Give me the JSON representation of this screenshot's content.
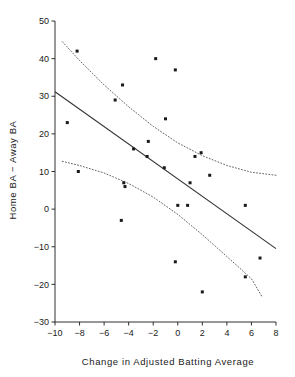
{
  "chart_data": {
    "type": "scatter",
    "title": "",
    "xlabel": "Change in Adjusted Batting Average",
    "ylabel": "Home BA − Away BA",
    "xlim": [
      -10,
      8
    ],
    "ylim": [
      -30,
      50
    ],
    "xticks": [
      -10,
      -8,
      -6,
      -4,
      -2,
      0,
      2,
      4,
      6,
      8
    ],
    "yticks": [
      -30,
      -20,
      -10,
      0,
      10,
      20,
      30,
      40,
      50
    ],
    "xticklabels": [
      "-10",
      "-8",
      "-6",
      "-4",
      "-2",
      "0",
      "2",
      "4",
      "6",
      "8"
    ],
    "yticklabels": [
      "-30",
      "-20",
      "-10",
      "0",
      "10",
      "20",
      "30",
      "40",
      "50"
    ],
    "grid": false,
    "legend": null,
    "marker": "square",
    "marker_color": "#1a1a1a",
    "points": [
      {
        "x": -8.2,
        "y": 42
      },
      {
        "x": -9.0,
        "y": 23
      },
      {
        "x": -8.1,
        "y": 10
      },
      {
        "x": -4.5,
        "y": 33
      },
      {
        "x": -5.1,
        "y": 29
      },
      {
        "x": -4.4,
        "y": 7
      },
      {
        "x": -4.3,
        "y": 6
      },
      {
        "x": -4.6,
        "y": -3
      },
      {
        "x": -3.6,
        "y": 16
      },
      {
        "x": -2.4,
        "y": 18
      },
      {
        "x": -2.5,
        "y": 14
      },
      {
        "x": -1.8,
        "y": 40
      },
      {
        "x": -1.0,
        "y": 24
      },
      {
        "x": -1.1,
        "y": 11
      },
      {
        "x": -0.2,
        "y": 37
      },
      {
        "x": -0.2,
        "y": -14
      },
      {
        "x": 0.0,
        "y": 1
      },
      {
        "x": 0.8,
        "y": 1
      },
      {
        "x": 1.0,
        "y": 7
      },
      {
        "x": 1.4,
        "y": 14
      },
      {
        "x": 1.9,
        "y": 15
      },
      {
        "x": 2.0,
        "y": -22
      },
      {
        "x": 2.6,
        "y": 9
      },
      {
        "x": 5.5,
        "y": 1
      },
      {
        "x": 5.5,
        "y": -18
      },
      {
        "x": 6.7,
        "y": -13
      }
    ],
    "fit_line": {
      "name": "regression line",
      "style": "solid",
      "color": "#333333",
      "x1": -10,
      "y1": 31.2,
      "x2": 8,
      "y2": -10.5
    },
    "confidence_bands": {
      "name": "95% confidence band",
      "style": "dotted",
      "color": "#555555",
      "upper": [
        {
          "x": -9.4,
          "y": 44.5
        },
        {
          "x": -8.0,
          "y": 39.5
        },
        {
          "x": -6.0,
          "y": 33.0
        },
        {
          "x": -4.0,
          "y": 27.2
        },
        {
          "x": -2.0,
          "y": 22.0
        },
        {
          "x": 0.0,
          "y": 17.6
        },
        {
          "x": 2.0,
          "y": 14.2
        },
        {
          "x": 4.0,
          "y": 11.6
        },
        {
          "x": 6.0,
          "y": 9.8
        },
        {
          "x": 8.0,
          "y": 9.0
        }
      ],
      "lower": [
        {
          "x": -9.4,
          "y": 12.7
        },
        {
          "x": -8.0,
          "y": 11.6
        },
        {
          "x": -6.0,
          "y": 9.6
        },
        {
          "x": -4.0,
          "y": 6.8
        },
        {
          "x": -2.0,
          "y": 3.2
        },
        {
          "x": 0.0,
          "y": -1.4
        },
        {
          "x": 2.0,
          "y": -6.8
        },
        {
          "x": 4.0,
          "y": -12.6
        },
        {
          "x": 6.0,
          "y": -18.5
        },
        {
          "x": 6.9,
          "y": -23.5
        }
      ]
    }
  }
}
